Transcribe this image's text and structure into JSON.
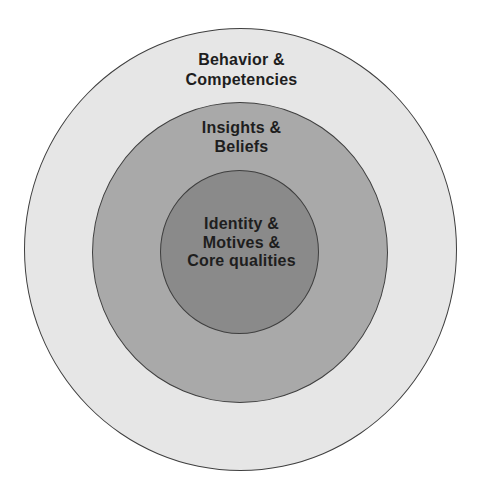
{
  "diagram": {
    "type": "concentric-circles",
    "colors": {
      "outer_fill": "#e6e6e6",
      "middle_fill": "#a9a9a9",
      "inner_fill": "#8a8a8a",
      "border": "#3f3f3f",
      "text": "#1e1e1e",
      "background": "#ffffff"
    },
    "layers": [
      {
        "level": "outer",
        "lines": [
          "Behavior &",
          "Competencies"
        ]
      },
      {
        "level": "middle",
        "lines": [
          "Insights &",
          "Beliefs"
        ]
      },
      {
        "level": "inner",
        "lines": [
          "Identity &",
          "Motives &",
          "Core qualities"
        ]
      }
    ]
  }
}
